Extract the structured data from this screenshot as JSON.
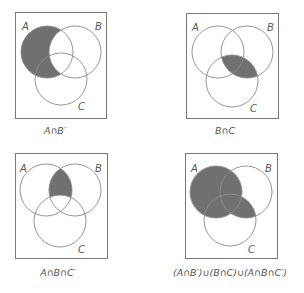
{
  "figure": {
    "colors": {
      "shade": "#707070",
      "stroke": "#8a8a8a",
      "frame": "#7a7a7a",
      "text": "#555555"
    },
    "panels": [
      {
        "id": "a-and-not-b",
        "caption": "A∩B′",
        "labels": {
          "a": "A",
          "b": "B",
          "c": "C"
        },
        "shaded_region": "A minus B"
      },
      {
        "id": "b-and-c",
        "caption": "B∩C",
        "labels": {
          "a": "A",
          "b": "B",
          "c": "C"
        },
        "shaded_region": "B intersect C"
      },
      {
        "id": "a-and-b-and-not-c",
        "caption": "A∩B∩C′",
        "labels": {
          "a": "A",
          "b": "B",
          "c": "C"
        },
        "shaded_region": "A intersect B minus C"
      },
      {
        "id": "union",
        "caption": "(A∩B′)∪(B∩C)∪(A∩B∩C′)",
        "labels": {
          "a": "A",
          "b": "B",
          "c": "C"
        },
        "shaded_region": "A union (B intersect C)"
      }
    ]
  }
}
